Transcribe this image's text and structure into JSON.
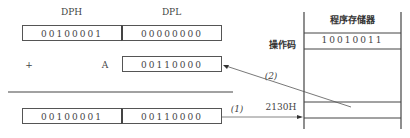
{
  "registers": {
    "dph_label": "DPH",
    "dpl_label": "DPL",
    "dph_value": "00100001",
    "dpl_value": "00000000"
  },
  "addend": {
    "plus_sign": "+",
    "label": "A",
    "value": "00110000"
  },
  "result": {
    "high": "00100001",
    "low": "00110000"
  },
  "memory": {
    "title": "程序存储器",
    "opcode_label": "操作码",
    "opcode_value": "10010011",
    "address_label": "2130H"
  },
  "arrows": {
    "step1": "(1)",
    "step2": "(2)"
  }
}
